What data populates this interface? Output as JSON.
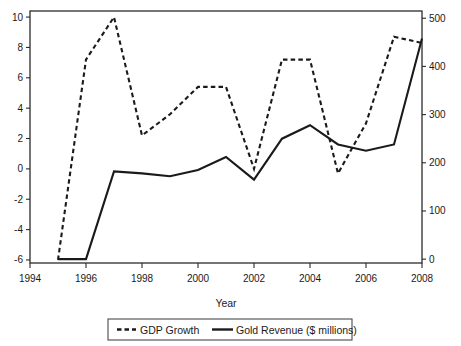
{
  "chart_data": {
    "type": "line",
    "title": "",
    "xlabel": "Year",
    "ylabel": "",
    "x": [
      1995,
      1996,
      1997,
      1998,
      1999,
      2000,
      2001,
      2002,
      2003,
      2004,
      2005,
      2006,
      2007,
      2008
    ],
    "xlim": [
      1994,
      2008
    ],
    "xticks": [
      1994,
      1996,
      1998,
      2000,
      2002,
      2004,
      2006,
      2008
    ],
    "xtick_labels": [
      "1994",
      "1996",
      "1998",
      "2000",
      "2002",
      "2004",
      "2006",
      "2008"
    ],
    "grid": false,
    "legend_position": "bottom",
    "axes": [
      {
        "id": "left",
        "label": "",
        "ylim": [
          -6.2,
          10.4
        ],
        "yticks": [
          -6,
          -4,
          -2,
          0,
          2,
          4,
          6,
          8,
          10
        ],
        "ytick_labels": [
          "-6",
          "-4",
          "-2",
          "0",
          "2",
          "4",
          "6",
          "8",
          "10"
        ]
      },
      {
        "id": "right",
        "label": "",
        "ylim": [
          -8,
          515
        ],
        "yticks": [
          0,
          100,
          200,
          300,
          400,
          500
        ],
        "ytick_labels": [
          "0",
          "100",
          "200",
          "300",
          "400",
          "500"
        ]
      }
    ],
    "series": [
      {
        "name": "GDP Growth",
        "axis": "left",
        "style": "dashed",
        "color": "#1a1a1a",
        "values": [
          -6.0,
          7.2,
          10.0,
          2.2,
          3.6,
          5.4,
          5.4,
          0.0,
          7.2,
          7.2,
          -0.3,
          3.0,
          8.7,
          8.3
        ]
      },
      {
        "name": "Gold Revenue ($ millions)",
        "axis": "right",
        "style": "solid",
        "color": "#1a1a1a",
        "values": [
          0,
          0,
          182,
          178,
          172,
          185,
          212,
          165,
          250,
          278,
          238,
          225,
          238,
          458
        ]
      }
    ],
    "legend": [
      {
        "label": "GDP Growth",
        "style": "dashed"
      },
      {
        "label": "Gold Revenue ($ millions)",
        "style": "solid"
      }
    ]
  }
}
